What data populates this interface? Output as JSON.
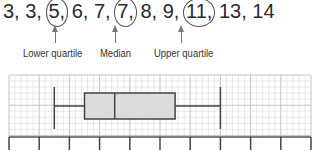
{
  "sequence": {
    "values": [
      "3",
      "3",
      "5",
      "6",
      "7",
      "7",
      "8",
      "9",
      "11",
      "13",
      "14"
    ],
    "circled_indices": [
      2,
      5,
      8
    ]
  },
  "annotations": [
    {
      "label": "Lower quartile",
      "value": "5"
    },
    {
      "label": "Median",
      "value": "7"
    },
    {
      "label": "Upper quartile",
      "value": "11"
    }
  ],
  "chart_data": {
    "type": "box",
    "title": "",
    "data": [
      3,
      3,
      5,
      6,
      7,
      7,
      8,
      9,
      11,
      13,
      14
    ],
    "summary": {
      "min": 3,
      "q1": 5,
      "median": 7,
      "q3": 11,
      "max": 14
    },
    "axis": {
      "min": 0,
      "max": 20,
      "tick_step": 2,
      "tick_labels_shown": false,
      "ticks": 11
    },
    "grid": true,
    "xlabel": "",
    "ylabel": "",
    "colors": {
      "box_fill": "#dcdcdc",
      "stroke": "#444444",
      "grid": "#d8d8d8",
      "grid_major": "#c4c4c4"
    }
  }
}
